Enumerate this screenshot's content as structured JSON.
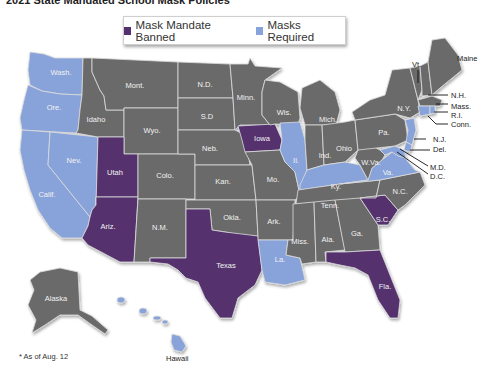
{
  "title": "2021 State Mandated School Mask Policies",
  "legend": {
    "items": [
      {
        "label": "Mask Mandate Banned",
        "color": "#54306e"
      },
      {
        "label": "Masks Required",
        "color": "#88a3d9"
      }
    ]
  },
  "colors": {
    "banned": "#54306e",
    "required": "#88a3d9",
    "none": "#6b6b6b",
    "border": "#dcdcdc"
  },
  "states": {
    "wash": "Wash.",
    "ore": "Ore.",
    "calif": "Calif.",
    "nev": "Nev.",
    "idaho": "Idaho",
    "mont": "Mont.",
    "wyo": "Wyo.",
    "utah": "Utah",
    "ariz": "Ariz.",
    "colo": "Colo.",
    "nm": "N.M.",
    "nd": "N.D.",
    "sd": "S.D",
    "neb": "Neb.",
    "kan": "Kan.",
    "okla": "Okla.",
    "texas": "Texas",
    "minn": "Minn.",
    "iowa": "Iowa",
    "mo": "Mo.",
    "ark": "Ark.",
    "la": "La.",
    "wis": "Wis.",
    "il": "Il.",
    "mich": "Mich.",
    "ind": "Ind.",
    "ohio": "Ohio",
    "ky": "Ky.",
    "tenn": "Tenn.",
    "miss": "Miss.",
    "ala": "Ala.",
    "ga": "Ga.",
    "fla": "Fla.",
    "sc": "S.C.",
    "nc": "N.C.",
    "va": "Va.",
    "wva": "W.Va.",
    "pa": "Pa.",
    "ny": "N.Y.",
    "vt": "Vt.",
    "nh": "N.H.",
    "maine": "Maine",
    "mass": "Mass.",
    "ri": "R.I.",
    "conn": "Conn.",
    "nj": "N.J.",
    "del": "Del.",
    "md": "M.D.",
    "dc": "D.C.",
    "alaska": "Alaska",
    "hawaii": "Hawaii"
  },
  "policy": {
    "banned": [
      "Utah",
      "Ariz.",
      "Texas",
      "Iowa",
      "S.C.",
      "Fla."
    ],
    "required": [
      "Wash.",
      "Ore.",
      "Calif.",
      "Nev.",
      "Il.",
      "Ky.",
      "La.",
      "Va.",
      "N.J.",
      "Del.",
      "M.D.",
      "D.C.",
      "Conn.",
      "R.I.",
      "Mass.",
      "Hawaii"
    ]
  },
  "footnote": "* As of Aug. 12"
}
